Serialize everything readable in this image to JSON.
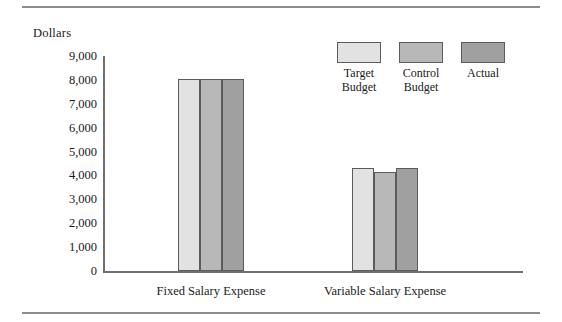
{
  "chart_data": {
    "type": "bar",
    "title": "",
    "xlabel": "",
    "ylabel": "Dollars",
    "ylim": [
      0,
      9000
    ],
    "ytick_labels": [
      "9,000",
      "8,000",
      "7,000",
      "6,000",
      "5,000",
      "4,000",
      "3,000",
      "2,000",
      "1,000",
      "0"
    ],
    "ytick_values": [
      9000,
      8000,
      7000,
      6000,
      5000,
      4000,
      3000,
      2000,
      1000,
      0
    ],
    "grid": false,
    "legend_position": "top-right",
    "categories": [
      "Fixed Salary Expense",
      "Variable Salary Expense"
    ],
    "series": [
      {
        "name": "Target Budget",
        "label_lines": "Target\nBudget",
        "color": "#e2e2e2",
        "values": [
          8050,
          4300
        ]
      },
      {
        "name": "Control Budget",
        "label_lines": "Control\nBudget",
        "color": "#b8b8b8",
        "values": [
          8050,
          4150
        ]
      },
      {
        "name": "Actual",
        "label_lines": "Actual",
        "color": "#a0a0a0",
        "values": [
          8050,
          4300
        ]
      }
    ]
  }
}
